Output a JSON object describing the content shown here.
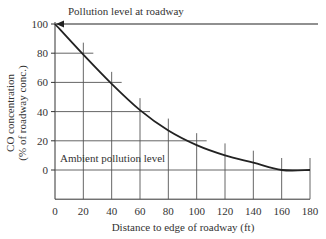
{
  "chart_data": {
    "type": "line",
    "title": "",
    "xlabel": "Distance to edge of roadway (ft)",
    "ylabel_line1": "CO concentration",
    "ylabel_line2": "(% of roadway conc.)",
    "xlim": [
      0,
      180
    ],
    "ylim": [
      -20,
      100
    ],
    "x_ticks": [
      0,
      20,
      40,
      60,
      80,
      100,
      120,
      140,
      160,
      180
    ],
    "y_ticks": [
      0,
      20,
      40,
      60,
      80,
      100
    ],
    "x": [
      0,
      20,
      40,
      60,
      80,
      100,
      120,
      140,
      160,
      180
    ],
    "series": [
      {
        "name": "CO concentration",
        "values": [
          100,
          79,
          59,
          41,
          27,
          17,
          10,
          5,
          0,
          0
        ]
      }
    ],
    "annotations": [
      {
        "text": "Pollution level at roadway",
        "at_y": 100,
        "arrow": "pointing left to y=100 at x=0"
      },
      {
        "text": "Ambient pollution level",
        "at_y": 0
      }
    ],
    "grid": "partial reference lines at each data point"
  }
}
